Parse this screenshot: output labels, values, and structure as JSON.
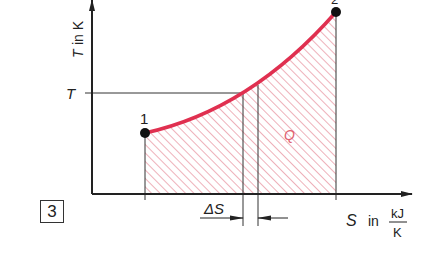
{
  "figure": {
    "number": "3",
    "y_axis": {
      "symbol": "T",
      "unit_text": "in K"
    },
    "x_axis": {
      "symbol": "S",
      "unit_in": "in",
      "unit_num": "kJ",
      "unit_den": "K"
    },
    "y_marker": "T",
    "points": [
      {
        "label": "1",
        "x": 145,
        "y": 133
      },
      {
        "label": "2",
        "x": 336,
        "y": 12
      }
    ],
    "area_label": "Q",
    "delta_label": "ΔS",
    "colors": {
      "curve": "#e03050",
      "hatch": "#e07080",
      "axis": "#222222"
    }
  }
}
